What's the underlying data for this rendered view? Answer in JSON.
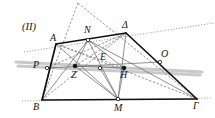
{
  "figure": {
    "number_label": "(II)",
    "kind": "euclidean-geometry-diagram",
    "canvas": {
      "width": 215,
      "height": 118,
      "background": "#ffffff"
    },
    "colors": {
      "solid_black": "#111111",
      "thin_gray": "#6e6e6e",
      "dashed_gray": "#7a7a7a",
      "dotted_gray": "#8a8a8a",
      "highlight_gray": "#c9c9c9",
      "point_fill": "#111111",
      "point_hollow": "#ffffff"
    },
    "vertex_labels": [
      {
        "id": "A",
        "text": "A",
        "x": 50,
        "y": 33,
        "anchor": "point-A"
      },
      {
        "id": "Delta",
        "text": "Δ",
        "x": 122,
        "y": 20,
        "anchor": "point-Delta"
      },
      {
        "id": "B",
        "text": "B",
        "x": 33,
        "y": 102,
        "anchor": "point-B"
      },
      {
        "id": "Gamma",
        "text": "Γ",
        "x": 193,
        "y": 101,
        "anchor": "point-Gamma"
      },
      {
        "id": "N",
        "text": "N",
        "x": 84,
        "y": 25,
        "anchor": "point-N"
      },
      {
        "id": "M",
        "text": "M",
        "x": 114,
        "y": 103,
        "anchor": "point-M"
      },
      {
        "id": "P",
        "text": "P",
        "x": 33,
        "y": 60,
        "anchor": "point-P"
      },
      {
        "id": "O",
        "text": "O",
        "x": 161,
        "y": 49,
        "anchor": "point-O"
      },
      {
        "id": "E",
        "text": "E",
        "x": 100,
        "y": 52,
        "anchor": "point-E"
      },
      {
        "id": "Z",
        "text": "Z",
        "x": 71,
        "y": 70,
        "anchor": "point-Z"
      },
      {
        "id": "H",
        "text": "H",
        "x": 120,
        "y": 70,
        "anchor": "point-H"
      }
    ],
    "points": [
      {
        "id": "A",
        "x": 56,
        "y": 44,
        "marker": "none"
      },
      {
        "id": "Delta",
        "x": 126,
        "y": 33,
        "marker": "none"
      },
      {
        "id": "B",
        "x": 42,
        "y": 100,
        "marker": "none"
      },
      {
        "id": "Gamma",
        "x": 197,
        "y": 99,
        "marker": "none"
      },
      {
        "id": "N",
        "x": 88,
        "y": 40,
        "marker": "hollow"
      },
      {
        "id": "M",
        "x": 118,
        "y": 99,
        "marker": "hollow"
      },
      {
        "id": "P",
        "x": 47,
        "y": 68,
        "marker": "hollow"
      },
      {
        "id": "O",
        "x": 160,
        "y": 62,
        "marker": "hollow"
      },
      {
        "id": "Z",
        "x": 75,
        "y": 66,
        "marker": "filled"
      },
      {
        "id": "E",
        "x": 100,
        "y": 68,
        "marker": "hollow"
      },
      {
        "id": "H",
        "x": 124,
        "y": 68,
        "marker": "filled"
      },
      {
        "id": "Apex",
        "x": 78,
        "y": 3,
        "marker": "none"
      }
    ],
    "solid_edges": [
      {
        "name": "side-A-Delta",
        "from": "A",
        "to": "Delta"
      },
      {
        "name": "side-Delta-Gamma",
        "from": "Delta",
        "to": "Gamma"
      },
      {
        "name": "side-B-Gamma",
        "from": "B",
        "to": "Gamma"
      },
      {
        "name": "side-A-B",
        "from": "A",
        "to": "B"
      }
    ],
    "thin_gray_segments": [
      {
        "name": "cevian-N-B",
        "from": "N",
        "to": "B"
      },
      {
        "name": "cevian-N-M",
        "from": "N",
        "to": "M"
      },
      {
        "name": "cevian-N-Gamma",
        "from": "N",
        "to": "Gamma"
      },
      {
        "name": "cevian-N-Z",
        "from": "N",
        "to": "Z"
      },
      {
        "name": "cevian-N-H",
        "from": "N",
        "to": "H"
      },
      {
        "name": "cevian-M-Z",
        "from": "M",
        "to": "Z"
      },
      {
        "name": "cevian-M-E",
        "from": "M",
        "to": "E"
      },
      {
        "name": "cevian-M-H",
        "from": "M",
        "to": "H"
      },
      {
        "name": "cevian-M-A",
        "from": "M",
        "to": "A"
      },
      {
        "name": "cevian-M-Delta",
        "from": "M",
        "to": "Delta"
      },
      {
        "name": "median-P-O",
        "from": "P",
        "to": "O"
      },
      {
        "name": "segment-Z-H",
        "from": "Z",
        "to": "H"
      }
    ],
    "dashed_segments": [
      {
        "name": "apex-leg-left",
        "from": "Apex",
        "to": "B"
      },
      {
        "name": "apex-leg-right",
        "from": "Apex",
        "to": "Gamma"
      },
      {
        "name": "diagonal-A-Gamma",
        "from": "A",
        "to": "Gamma"
      },
      {
        "name": "diagonal-B-Delta",
        "from": "B",
        "to": "Delta"
      },
      {
        "name": "chord-P-Delta",
        "from": "P",
        "to": "Delta"
      },
      {
        "name": "chord-A-H",
        "from": "A",
        "to": "H"
      },
      {
        "name": "chord-Z-Delta",
        "from": "Z",
        "to": "Delta"
      }
    ],
    "dotted_lines": [
      {
        "name": "dotted-transversal-upper",
        "x1": 24,
        "y1": 52,
        "x2": 214,
        "y2": 23
      },
      {
        "name": "dotted-baseline-extension",
        "x1": 22,
        "y1": 101,
        "x2": 212,
        "y2": 98
      }
    ],
    "highlight_lines": [
      {
        "name": "highlight-band-upper",
        "x1": 16,
        "y1": 62,
        "x2": 202,
        "y2": 72
      },
      {
        "name": "highlight-band-lower",
        "x1": 18,
        "y1": 66,
        "x2": 200,
        "y2": 75
      }
    ],
    "label_hints": {
      "style": "italic serif greek/latin capitals",
      "font_size_px": 10
    }
  }
}
